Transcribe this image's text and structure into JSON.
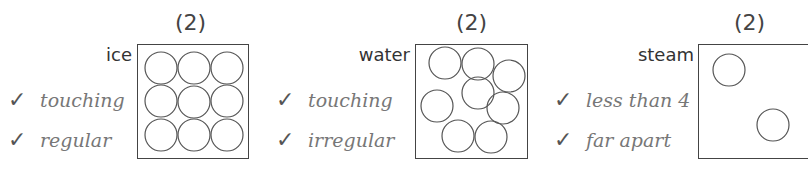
{
  "panels": [
    {
      "marks": "(2)",
      "state": "ice",
      "checks": [
        {
          "tick": "✓",
          "text": "touching"
        },
        {
          "tick": "✓",
          "text": "regular"
        }
      ]
    },
    {
      "marks": "(2)",
      "state": "water",
      "checks": [
        {
          "tick": "✓",
          "text": "touching"
        },
        {
          "tick": "✓",
          "text": "irregular"
        }
      ]
    },
    {
      "marks": "(2)",
      "state": "steam",
      "checks": [
        {
          "tick": "✓",
          "text": "less than 4"
        },
        {
          "tick": "✓",
          "text": "far apart"
        }
      ]
    }
  ]
}
